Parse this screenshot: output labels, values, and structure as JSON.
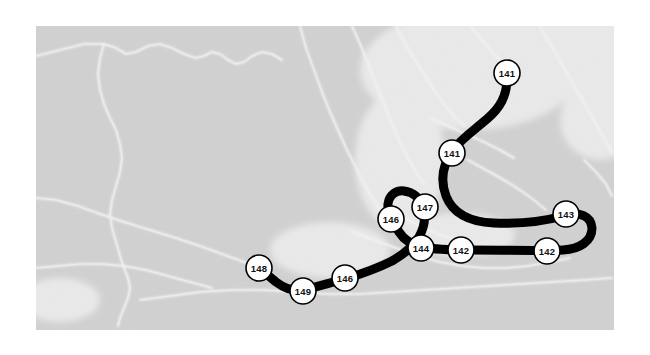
{
  "figure": {
    "canvas": {
      "width": 650,
      "height": 355,
      "background": "#ffffff"
    }
  },
  "basemap": {
    "name": "grayscale-terrain-basemap",
    "bounds": {
      "x": 36,
      "y": 26,
      "width": 578,
      "height": 304
    },
    "ocean_color": "#d2d2d2",
    "land_color": "#f2f2f2",
    "highlight_color": "#ffffff",
    "noise_color": "#c9c9c9"
  },
  "track": {
    "name": "storm-track-line",
    "color": "#000000",
    "width_px": 9,
    "marker": {
      "fill": "#ffffff",
      "stroke": "#000000",
      "stroke_width": 1.6,
      "radius": 13
    },
    "path": "M 507 78 C 507 96 500 108 487 119 C 473 131 461 139 453 150 C 443 164 440 180 446 196 C 453 214 470 222 494 223 C 520 224 545 221 563 216 C 580 211 591 216 592 228 C 592 241 580 249 563 250 C 540 251 500 250 470 250 C 448 250 432 249 423 247 C 412 245 404 240 399 232 C 392 221 387 212 388 204 C 389 195 396 190 404 191 C 413 192 420 198 423 207 C 426 217 424 228 419 237 C 414 246 404 254 392 261 C 376 269 358 275 345 279 C 330 283 316 287 304 290 C 293 292 284 288 276 282 C 270 277 264 272 259 268"
  },
  "markers": [
    {
      "id": "marker-141-a",
      "label": "141",
      "cx": 507,
      "cy": 73
    },
    {
      "id": "marker-141-b",
      "label": "141",
      "cx": 452,
      "cy": 153
    },
    {
      "id": "marker-143",
      "label": "143",
      "cx": 566,
      "cy": 214
    },
    {
      "id": "marker-142-a",
      "label": "142",
      "cx": 547,
      "cy": 251
    },
    {
      "id": "marker-142-b",
      "label": "142",
      "cx": 461,
      "cy": 250
    },
    {
      "id": "marker-144",
      "label": "144",
      "cx": 421,
      "cy": 248
    },
    {
      "id": "marker-147",
      "label": "147",
      "cx": 425,
      "cy": 207
    },
    {
      "id": "marker-146-a",
      "label": "146",
      "cx": 391,
      "cy": 219
    },
    {
      "id": "marker-146-b",
      "label": "146",
      "cx": 345,
      "cy": 278
    },
    {
      "id": "marker-149",
      "label": "149",
      "cx": 303,
      "cy": 291
    },
    {
      "id": "marker-148",
      "label": "148",
      "cx": 259,
      "cy": 268
    }
  ],
  "coastlines": [
    "M 36 56 L 60 50 L 84 44 L 104 44 L 116 48 L 126 54 L 136 52 L 148 46 L 160 44 L 172 48 L 184 54 L 196 58 L 204 56 L 212 52 L 220 54 L 228 60 L 236 64 L 244 62 L 252 56 L 262 52 L 272 54 L 282 60",
    "M 104 44 L 100 58 L 98 74 L 100 90 L 104 104 L 110 118 L 116 130 L 120 144 L 122 158 L 120 172 L 116 186 L 112 200 L 110 214 L 112 228 L 116 242 L 120 256 L 124 268 L 128 278 L 130 288 L 128 298 L 124 308 L 120 318 L 118 326",
    "M 36 198 L 56 200 L 78 206 L 100 214 L 124 222 L 150 230 L 176 238 L 200 246 L 222 254 L 244 262 L 262 268",
    "M 140 300 L 170 296 L 200 292 L 232 290 L 264 290 L 296 292 L 328 294 L 360 294 L 392 292 L 424 290 L 456 288 L 488 286 L 520 284 L 552 282 L 584 280 L 612 278",
    "M 300 26 L 306 48 L 314 70 L 322 92 L 330 112 L 338 130 L 346 148 L 354 164 L 362 180 L 370 194 L 378 206 L 386 216",
    "M 352 26 L 360 44 L 368 64 L 376 84 L 384 104 L 392 124 L 400 142 L 408 158 L 416 172 L 424 184",
    "M 396 26 L 404 42 L 414 58 L 424 74 L 434 90 L 444 104 L 454 116 L 464 126",
    "M 430 118 L 448 126 L 466 134 L 484 142 L 500 150 L 514 158",
    "M 468 160 L 486 170 L 504 180 L 520 190 L 534 200 L 546 210",
    "M 352 232 L 374 240 L 396 248 L 418 256 L 440 262 L 462 266 L 484 268 L 506 268 L 528 266 L 550 262 L 570 258",
    "M 396 214 L 412 222 L 428 230 L 444 236 L 460 240",
    "M 470 26 L 482 40 L 494 54 L 506 66",
    "M 540 26 L 548 40 L 556 54 L 564 68 L 572 82 L 580 96 L 588 110 L 596 124 L 604 138 L 612 152",
    "M 584 160 L 596 172 L 606 184 L 612 196",
    "M 36 268 L 58 266 L 80 264 L 102 264 L 124 266 L 146 270 L 168 276 L 190 282 L 212 288"
  ],
  "land_patches": [
    {
      "name": "north-ice-patch",
      "cx": 470,
      "cy": 70,
      "rx": 110,
      "ry": 60
    },
    {
      "name": "northeast-ice-patch",
      "cx": 580,
      "cy": 50,
      "rx": 70,
      "ry": 45
    },
    {
      "name": "east-ice-patch",
      "cx": 600,
      "cy": 120,
      "rx": 40,
      "ry": 40
    },
    {
      "name": "central-highland-patch",
      "cx": 400,
      "cy": 160,
      "rx": 45,
      "ry": 70
    },
    {
      "name": "south-coast-patch",
      "cx": 330,
      "cy": 250,
      "rx": 60,
      "ry": 28
    },
    {
      "name": "mid-river-patch",
      "cx": 460,
      "cy": 235,
      "rx": 55,
      "ry": 22
    },
    {
      "name": "west-edge-patch",
      "cx": 60,
      "cy": 300,
      "rx": 40,
      "ry": 22
    }
  ]
}
